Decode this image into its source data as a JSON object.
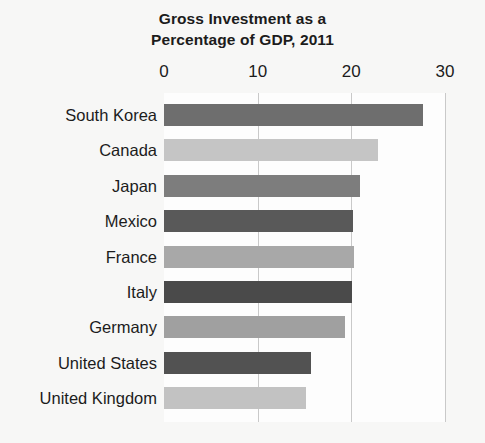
{
  "chart_data": {
    "type": "bar",
    "orientation": "horizontal",
    "title": "Gross Investment as a Percentage of GDP, 2011",
    "title_lines": [
      "Gross Investment as a",
      "Percentage of GDP, 2011"
    ],
    "xlabel": "",
    "ylabel": "",
    "xlim": [
      0,
      30
    ],
    "xticks": [
      0,
      10,
      20,
      30
    ],
    "xtick_labels": [
      "0",
      "10",
      "20",
      "30"
    ],
    "grid": "vertical",
    "legend": "none",
    "categories": [
      "South Korea",
      "Canada",
      "Japan",
      "Mexico",
      "France",
      "Italy",
      "Germany",
      "United States",
      "United Kingdom"
    ],
    "values": [
      27.6,
      22.8,
      20.9,
      20.2,
      20.3,
      20.1,
      19.3,
      15.7,
      15.2
    ],
    "bar_colors": [
      "#6e6e6e",
      "#c5c5c5",
      "#7d7d7d",
      "#595959",
      "#a8a8a8",
      "#4a4a4a",
      "#a0a0a0",
      "#525252",
      "#c2c2c2"
    ],
    "bars": [
      {
        "label": "South Korea",
        "value": 27.6,
        "color": "#6e6e6e"
      },
      {
        "label": "Canada",
        "value": 22.8,
        "color": "#c5c5c5"
      },
      {
        "label": "Japan",
        "value": 20.9,
        "color": "#7d7d7d"
      },
      {
        "label": "Mexico",
        "value": 20.2,
        "color": "#595959"
      },
      {
        "label": "France",
        "value": 20.3,
        "color": "#a8a8a8"
      },
      {
        "label": "Italy",
        "value": 20.1,
        "color": "#4a4a4a"
      },
      {
        "label": "Germany",
        "value": 19.3,
        "color": "#a0a0a0"
      },
      {
        "label": "United States",
        "value": 15.7,
        "color": "#525252"
      },
      {
        "label": "United Kingdom",
        "value": 15.2,
        "color": "#c2c2c2"
      }
    ]
  },
  "colors": {
    "background": "#f7f7f6",
    "plot_background": "#fdfdfd",
    "gridline": "#c9c9c9",
    "text": "#1c1c1c"
  }
}
